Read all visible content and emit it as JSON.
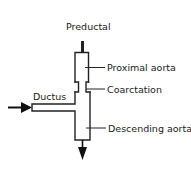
{
  "diagram": {
    "type": "flow-schematic",
    "colors": {
      "line": "#222222",
      "text": "#1a1a1a",
      "background": "#ffffff"
    },
    "labels": {
      "preductal": "Preductal",
      "proximal_aorta": "Proximal aorta",
      "coarctation": "Coarctation",
      "ductus": "Ductus",
      "descending_aorta": "Descending aorta"
    },
    "arrows": [
      {
        "name": "ductus-inflow-arrow",
        "direction": "right"
      },
      {
        "name": "descending-outflow-arrow",
        "direction": "down"
      }
    ]
  }
}
